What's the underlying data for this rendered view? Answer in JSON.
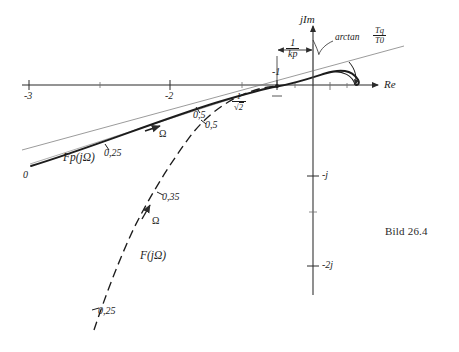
{
  "figure": {
    "caption": "Bild 26.4",
    "axes": {
      "real_axis_label": "Re",
      "imag_axis_label": "jIm",
      "real_ticks": [
        {
          "label": "-3",
          "value": -3
        },
        {
          "label": "-2",
          "value": -2
        },
        {
          "label": "-1",
          "value": -1
        }
      ],
      "imag_ticks": [
        {
          "label": "-j",
          "value": -1
        },
        {
          "label": "-2j",
          "value": -2
        }
      ]
    },
    "annotations": {
      "arctan_label": "arctan",
      "arctan_fraction_numerator": "Tq",
      "arctan_fraction_denominator": "T0",
      "gain_margin_numerator": "1",
      "gain_margin_denominator": "kp",
      "crossing_numerator": "1",
      "crossing_denominator": "2",
      "crossing_radical": "√"
    },
    "curves": [
      {
        "name": "compensated-locus",
        "label": "Fp(jΩ)",
        "style": "solid",
        "direction_marker": "Ω",
        "points": [
          {
            "label": "0",
            "omega": 0
          },
          {
            "label": "0,25",
            "omega": 0.25
          },
          {
            "label": "0,5",
            "omega": 0.5
          }
        ]
      },
      {
        "name": "uncompensated-locus",
        "label": "F(jΩ)",
        "style": "dashed",
        "direction_marker": "Ω",
        "points": [
          {
            "label": "0,25",
            "omega": 0.25
          },
          {
            "label": "0,35",
            "omega": 0.35
          },
          {
            "label": "0,5",
            "omega": 0.5
          }
        ]
      }
    ],
    "colors": {
      "ink": "#1c1c1c",
      "axis": "#3a3a3a",
      "light_line": "#6e6e6e",
      "background": "#ffffff"
    }
  }
}
